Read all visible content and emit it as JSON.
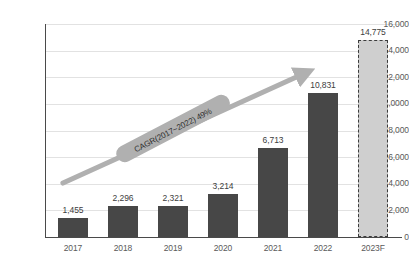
{
  "chart_data": {
    "type": "bar",
    "title": "",
    "subtitle": "",
    "xlabel": "",
    "ylabel": "",
    "categories": [
      "2017",
      "2018",
      "2019",
      "2020",
      "2021",
      "2022",
      "2023F"
    ],
    "values": [
      1455,
      2296,
      2321,
      3214,
      6713,
      10831,
      14775
    ],
    "value_labels": [
      "1,455",
      "2,296",
      "2,321",
      "3,214",
      "6,713",
      "10,831",
      "14,775"
    ],
    "series": [
      {
        "name": "",
        "values": [
          1455,
          2296,
          2321,
          3214,
          6713,
          10831,
          14775
        ],
        "styles": [
          "actual",
          "actual",
          "actual",
          "actual",
          "actual",
          "actual",
          "forecast"
        ]
      }
    ],
    "ylim": [
      0,
      16000
    ],
    "ytick_values": [
      0,
      2000,
      4000,
      6000,
      8000,
      10000,
      12000,
      14000,
      16000
    ],
    "ytick_labels": [
      "0",
      "2,000",
      "4,000",
      "6,000",
      "8,000",
      "1,0000",
      "12,000",
      "14,000",
      "16,000"
    ],
    "grid": true,
    "legend": "none",
    "annotations": [
      {
        "name": "cagr-arrow",
        "text": "CAGR(2017~2022) 49%",
        "kind": "arrow",
        "direction": "up-right"
      }
    ],
    "colors": {
      "bar_actual": "#474747",
      "bar_forecast": "#cfcfcf",
      "bar_forecast_border": "#3b3b3b",
      "arrow": "#b0b0b0",
      "gridline": "#e2e2e2",
      "axis": "#4a4a4a",
      "tick_text": "#5a5a5a",
      "label_text": "#3d3d3d"
    }
  }
}
